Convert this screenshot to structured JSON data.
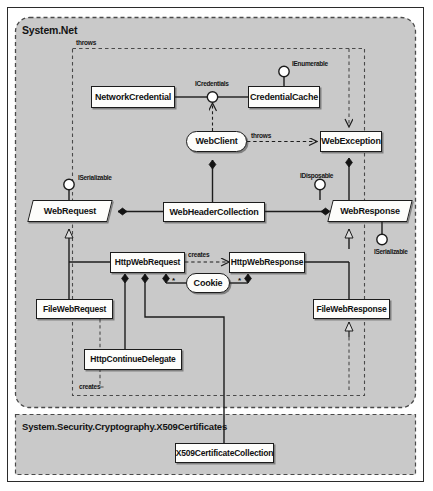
{
  "diagram": {
    "bg_page": "#ffffff",
    "bg_package": "#c9c9c9",
    "node_fill": "#fdfdfb",
    "line_color": "#1c1c1c"
  },
  "packages": [
    {
      "id": "pkg-system-net",
      "label": "System.Net"
    },
    {
      "id": "pkg-x509",
      "label": "System.Security.Cryptography.X509Certificates"
    }
  ],
  "nodes": [
    {
      "id": "network-credential",
      "label": "NetworkCredential",
      "shape": "rect"
    },
    {
      "id": "credential-cache",
      "label": "CredentialCache",
      "shape": "rect"
    },
    {
      "id": "web-client",
      "label": "WebClient",
      "shape": "rounded"
    },
    {
      "id": "web-exception",
      "label": "WebException",
      "shape": "rect"
    },
    {
      "id": "web-request",
      "label": "WebRequest",
      "shape": "parallelogram"
    },
    {
      "id": "web-header-collection",
      "label": "WebHeaderCollection",
      "shape": "rect"
    },
    {
      "id": "web-response",
      "label": "WebResponse",
      "shape": "parallelogram"
    },
    {
      "id": "http-web-request",
      "label": "HttpWebRequest",
      "shape": "rect"
    },
    {
      "id": "http-web-response",
      "label": "HttpWebResponse",
      "shape": "rect"
    },
    {
      "id": "cookie",
      "label": "Cookie",
      "shape": "rounded"
    },
    {
      "id": "file-web-request",
      "label": "FileWebRequest",
      "shape": "rect"
    },
    {
      "id": "file-web-response",
      "label": "FileWebResponse",
      "shape": "rect"
    },
    {
      "id": "http-continue-delegate",
      "label": "HttpContinueDelegate",
      "shape": "rect"
    },
    {
      "id": "x509-certificate-collection",
      "label": "X509CertificateCollection",
      "shape": "rect"
    }
  ],
  "interfaces": [
    {
      "id": "if-icredentials",
      "label": "ICredentials",
      "owner": "network-credential"
    },
    {
      "id": "if-ienumerable",
      "label": "IEnumerable",
      "owner": "credential-cache"
    },
    {
      "id": "if-iserializable-request",
      "label": "ISerializable",
      "owner": "web-request"
    },
    {
      "id": "if-idisposable",
      "label": "IDisposable",
      "owner": "web-response"
    },
    {
      "id": "if-iserializable-response",
      "label": "ISerializable",
      "owner": "web-response"
    }
  ],
  "edge_labels": [
    {
      "id": "lbl-throws-top",
      "text": "throws"
    },
    {
      "id": "lbl-throws-client",
      "text": "throws"
    },
    {
      "id": "lbl-creates-http",
      "text": "creates"
    },
    {
      "id": "lbl-creates-file",
      "text": "creates"
    }
  ],
  "multiplicities": [
    {
      "id": "mult-cookie-left",
      "text": "*"
    },
    {
      "id": "mult-cookie-right",
      "text": "*"
    }
  ]
}
